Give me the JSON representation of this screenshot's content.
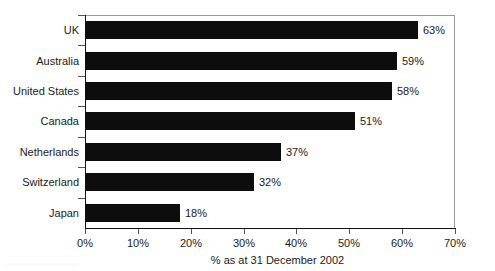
{
  "chart_data": {
    "type": "bar",
    "orientation": "horizontal",
    "title": "",
    "subtitle": "",
    "xlabel": "% as at 31 December 2002",
    "ylabel": "",
    "categories": [
      "UK",
      "Australia",
      "United States",
      "Canada",
      "Netherlands",
      "Switzerland",
      "Japan"
    ],
    "values": [
      63,
      59,
      58,
      51,
      37,
      32,
      18
    ],
    "data_labels": [
      "63%",
      "59%",
      "58%",
      "51%",
      "37%",
      "32%",
      "18%"
    ],
    "xlim": [
      0,
      70
    ],
    "xticks": [
      0,
      10,
      20,
      30,
      40,
      50,
      60,
      70
    ],
    "xticklabels": [
      "0%",
      "10%",
      "20%",
      "30%",
      "40%",
      "50%",
      "60%",
      "70%"
    ],
    "grid": false,
    "legend": null,
    "bar_color": "#0d0d0d",
    "axis_color": "#141414",
    "frame_color": "#9a9a9a",
    "text_color": "#1a1a1a"
  }
}
